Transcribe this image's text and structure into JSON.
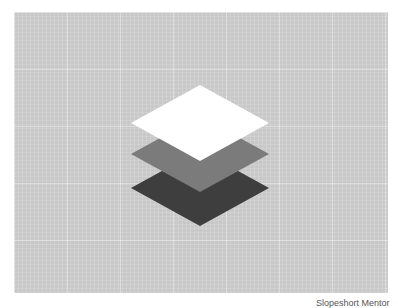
{
  "illustration": {
    "name": "layers-stack",
    "layers": [
      {
        "name": "bottom-layer",
        "color": "#3e3e3e"
      },
      {
        "name": "middle-layer",
        "color": "#7b7b7b"
      },
      {
        "name": "top-layer",
        "color": "#ffffff"
      }
    ],
    "background_color": "#c8c8c8"
  },
  "caption": {
    "text": "Slopeshort Mentor"
  }
}
